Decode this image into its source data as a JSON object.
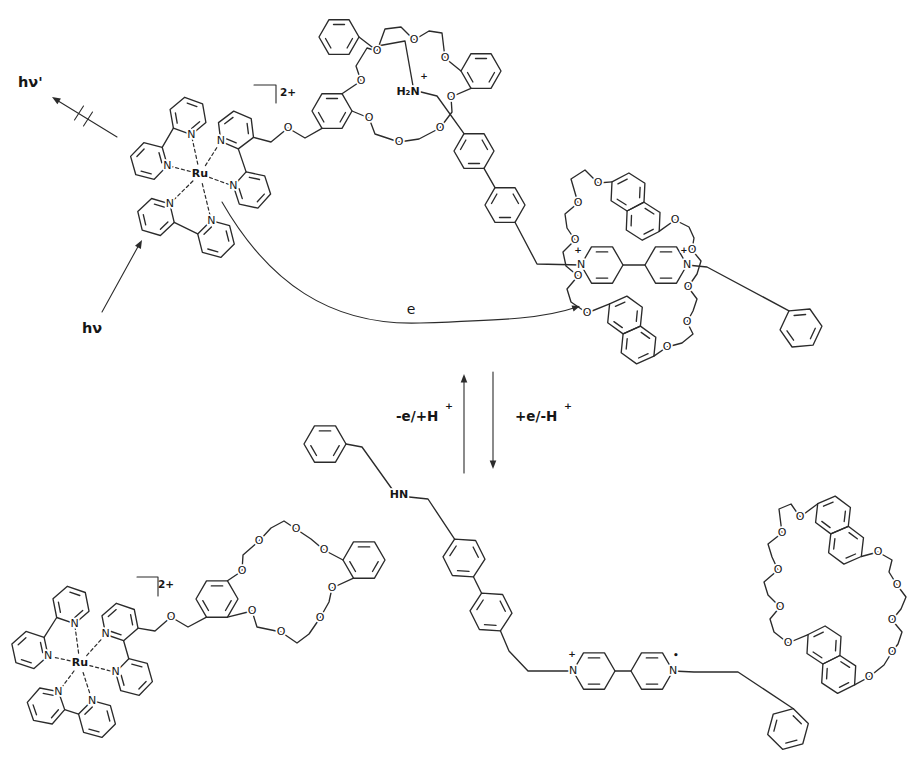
{
  "molecule_labels": {
    "ruthenium": "Ru",
    "nitrogen": "N",
    "oxygen": "O",
    "ammonium": "H₂N",
    "amine": "HN",
    "plus": "+",
    "radical_dot": "•",
    "overall_charge": "2+"
  },
  "annotations": {
    "excitation": "hν",
    "emission_blocked": "hν'",
    "electron_transfer": "e",
    "deprotonation_path": "-e/+H",
    "deprotonation_sup": "+",
    "reduction_path": "+e/-H",
    "reduction_sup": "+"
  }
}
